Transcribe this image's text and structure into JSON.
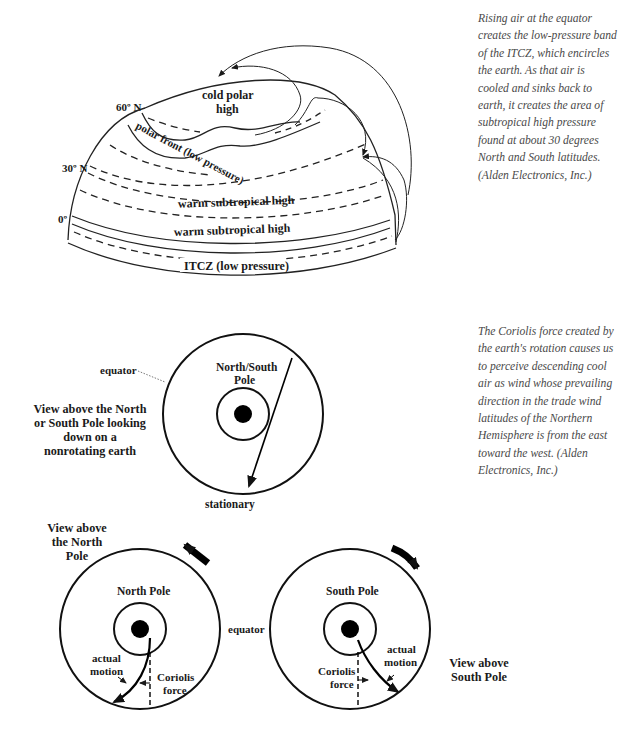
{
  "figure1": {
    "latitude_labels": {
      "lat60": "60º N",
      "lat30": "30º N",
      "lat0": "0º"
    },
    "zones": {
      "cold_polar_line1": "cold polar",
      "cold_polar_line2": "high",
      "polar_front": "polar front (low pressure)",
      "warm_subtropical_1": "warm subtropical high",
      "warm_subtropical_2": "warm subtropical high",
      "itcz": "ITCZ (low pressure)"
    },
    "caption": "Rising air at the equator creates the low-pressure band of the ITCZ, which encircles the earth. As that air is cooled and sinks back to earth, it creates the area of subtropical high pressure found at about 30 degrees North and South latitudes. (Alden Electronics, Inc.)"
  },
  "figure2": {
    "equator_label": "equator",
    "pole_label_line1": "North/South",
    "pole_label_line2": "Pole",
    "stationary_label": "stationary",
    "view_label": [
      "View above the North",
      "or South Pole looking",
      "down on a",
      "nonrotating earth"
    ],
    "caption": "The Coriolis force created by the earth's rotation causes us to perceive descending cool air as wind whose prevailing direction in the trade wind latitudes of the Northern Hemisphere is from the east toward the west. (Alden Electronics, Inc.)"
  },
  "figure3": {
    "north_view_label": [
      "View above",
      "the North",
      "Pole"
    ],
    "south_view_label": [
      "View above",
      "South Pole"
    ],
    "north_pole_label": "North Pole",
    "south_pole_label": "South Pole",
    "equator_label": "equator",
    "actual_motion": [
      "actual",
      "motion"
    ],
    "coriolis_force": [
      "Coriolis",
      "force"
    ]
  }
}
